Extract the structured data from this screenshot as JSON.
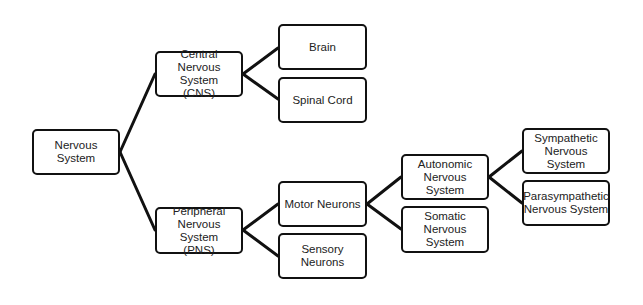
{
  "diagram": {
    "title": "",
    "colors": {
      "border": "#111111",
      "line": "#111111",
      "text": "#222222",
      "background": "#ffffff"
    },
    "nodes": {
      "nervous_system": "Nervous System",
      "cns": "Central\nNervous System\n(CNS)",
      "brain": "Brain",
      "spinal_cord": "Spinal Cord",
      "pns": "Peripheral\nNervous System\n(PNS)",
      "motor_neurons": "Motor Neurons",
      "sensory_neurons": "Sensory Neurons",
      "autonomic": "Autonomic\nNervous System",
      "somatic": "Somatic\nNervous System",
      "sympathetic": "Sympathetic\nNervous System",
      "parasympathetic": "Parasympathetic\nNervous System"
    },
    "edges": [
      [
        "nervous_system",
        "cns"
      ],
      [
        "nervous_system",
        "pns"
      ],
      [
        "cns",
        "brain"
      ],
      [
        "cns",
        "spinal_cord"
      ],
      [
        "pns",
        "motor_neurons"
      ],
      [
        "pns",
        "sensory_neurons"
      ],
      [
        "motor_neurons",
        "autonomic"
      ],
      [
        "motor_neurons",
        "somatic"
      ],
      [
        "autonomic",
        "sympathetic"
      ],
      [
        "autonomic",
        "parasympathetic"
      ]
    ]
  }
}
